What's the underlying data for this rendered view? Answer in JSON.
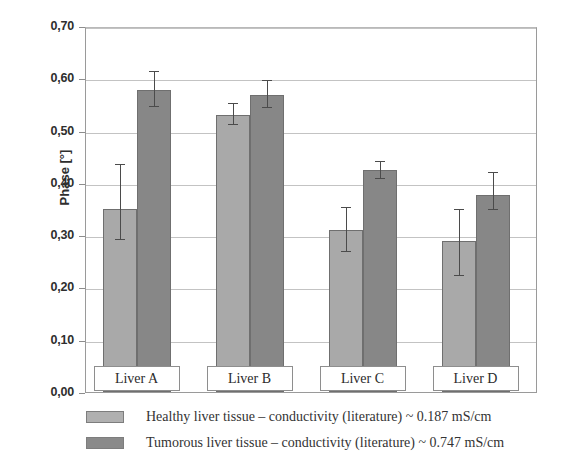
{
  "chart_data": {
    "type": "bar",
    "title": "",
    "xlabel": "",
    "ylabel": "Phase [°]",
    "ylim": [
      0.0,
      0.7
    ],
    "ytick_labels": [
      "0,70",
      "0,60",
      "0,50",
      "0,40",
      "0,30",
      "0,20",
      "0,10",
      "0,00"
    ],
    "ytick_values": [
      0.7,
      0.6,
      0.5,
      0.4,
      0.3,
      0.2,
      0.1,
      0.0
    ],
    "grid": "horizontal",
    "legend_position": "below-plot",
    "categories": [
      "Liver A",
      "Liver B",
      "Liver C",
      "Liver D"
    ],
    "series": [
      {
        "name": "Healthy liver tissue – conductivity (literature) ~ 0.187 mS/cm",
        "short_name": "Healthy liver tissue",
        "color": "#a9a9a9",
        "values": [
          0.35,
          0.53,
          0.31,
          0.288
        ],
        "err_low": [
          0.29,
          0.51,
          0.268,
          0.222
        ],
        "err_high": [
          0.436,
          0.552,
          0.354,
          0.35
        ]
      },
      {
        "name": "Tumorous liver tissue – conductivity (literature) ~ 0.747 mS/cm",
        "short_name": "Tumorous liver tissue",
        "color": "#878787",
        "values": [
          0.578,
          0.568,
          0.425,
          0.377
        ],
        "err_low": [
          0.545,
          0.543,
          0.408,
          0.348
        ],
        "err_high": [
          0.614,
          0.596,
          0.442,
          0.42
        ]
      }
    ]
  },
  "legend": {
    "items": [
      {
        "label": "Healthy liver tissue – conductivity (literature) ~ 0.187 mS/cm",
        "swatch": "healthy"
      },
      {
        "label": "Tumorous liver tissue – conductivity (literature) ~ 0.747 mS/cm",
        "swatch": "tumorous"
      }
    ]
  },
  "axis": {
    "y_title": "Phase [°]"
  }
}
